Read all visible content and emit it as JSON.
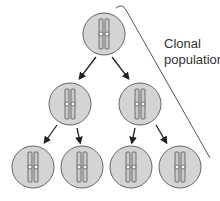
{
  "label": {
    "line1": "Clonal",
    "line2": "population"
  },
  "colors": {
    "cell_fill": "#d4d4d4",
    "cell_stroke": "#666666",
    "chromosome": "#c9c9c9",
    "line": "#333333",
    "bracket": "#555555",
    "text": "#333333"
  },
  "generations": [
    {
      "name": "parent",
      "count": 1
    },
    {
      "name": "generation-1",
      "count": 2
    },
    {
      "name": "generation-2",
      "count": 4
    }
  ]
}
